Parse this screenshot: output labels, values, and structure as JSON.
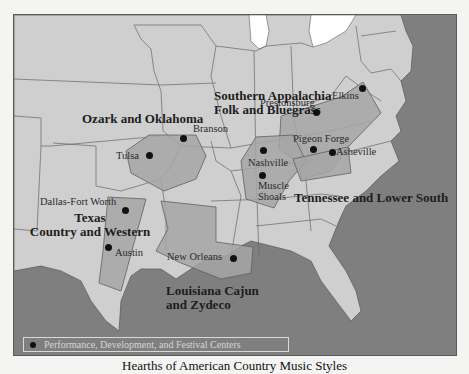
{
  "caption": "Hearths of American Country Music Styles",
  "colors": {
    "water": "#7f7f7f",
    "land": "#cfcfcf",
    "region_fill": "#a6a6a6",
    "border": "#5f5f5f",
    "lake": "#ffffff"
  },
  "regions": [
    {
      "id": "southern-appalachia",
      "label_line1": "Southern Appalachia",
      "label_line2": "Folk and Bluegrass"
    },
    {
      "id": "ozark-oklahoma",
      "label_line1": "Ozark and Oklahoma"
    },
    {
      "id": "tennessee-lower-south",
      "label_line1": "Tennessee and Lower South"
    },
    {
      "id": "texas",
      "label_line1": "Texas",
      "label_line2": "Country and Western"
    },
    {
      "id": "louisiana",
      "label_line1": "Louisiana Cajun",
      "label_line2": "and Zydeco"
    }
  ],
  "cities": [
    {
      "name": "Branson"
    },
    {
      "name": "Tulsa"
    },
    {
      "name": "Prestonsburg"
    },
    {
      "name": "Elkins"
    },
    {
      "name": "Pigeon Forge"
    },
    {
      "name": "Asheville"
    },
    {
      "name": "Nashville"
    },
    {
      "name": "Muscle Shoals"
    },
    {
      "name": "Dallas-Fort Worth"
    },
    {
      "name": "Austin"
    },
    {
      "name": "New Orleans"
    }
  ],
  "legend": {
    "symbol": "black-dot",
    "label": "Performance, Development, and Festival Centers"
  }
}
